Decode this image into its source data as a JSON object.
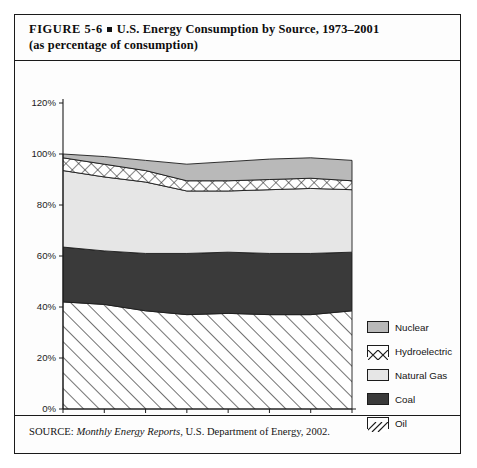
{
  "figure": {
    "label": "FIGURE  5-6",
    "title_line1": "U.S. Energy Consumption by Source, 1973–2001",
    "title_line2": "(as percentage of consumption)",
    "source_prefix": "SOURCE:",
    "source_italic": "Monthly Energy Reports",
    "source_rest": ", U.S. Department of Energy, 2002."
  },
  "legend": {
    "items": [
      {
        "label": "Nuclear",
        "pattern": "solid-medium-gray",
        "color": "#b9b9b9"
      },
      {
        "label": "Hydroelectric",
        "pattern": "cross-hatch",
        "color": "#ffffff"
      },
      {
        "label": "Natural Gas",
        "pattern": "solid-light-gray",
        "color": "#e6e6e6"
      },
      {
        "label": "Coal",
        "pattern": "solid-dark",
        "color": "#3a3a3a"
      },
      {
        "label": "Oil",
        "pattern": "diagonal-hatch",
        "color": "#ffffff"
      }
    ]
  },
  "chart_data": {
    "type": "area",
    "title": "U.S. Energy Consumption by Source, 1973–2001",
    "subtitle": "(as percentage of consumption)",
    "xlabel": "",
    "ylabel": "",
    "stacked": true,
    "grid": false,
    "legend_position": "right",
    "ylim": [
      0,
      120
    ],
    "yticks": [
      0,
      20,
      40,
      60,
      80,
      100,
      120
    ],
    "ytick_labels": [
      "0%",
      "20%",
      "40%",
      "60%",
      "80%",
      "100%",
      "120%"
    ],
    "xticks": [
      1973,
      1977,
      1981,
      1985,
      1989,
      1993,
      1997,
      2001
    ],
    "xtick_labels": [
      "1973",
      "1977",
      "1981",
      "1985",
      "1989",
      "1993",
      "1997",
      "2001"
    ],
    "x": [
      1973,
      1977,
      1981,
      1985,
      1989,
      1993,
      1997,
      2001
    ],
    "series": [
      {
        "name": "Oil",
        "values": [
          42.0,
          41.0,
          38.5,
          37.0,
          37.5,
          37.0,
          37.0,
          38.5
        ]
      },
      {
        "name": "Coal",
        "values": [
          21.5,
          21.0,
          22.5,
          24.0,
          24.0,
          24.0,
          24.0,
          23.0
        ]
      },
      {
        "name": "Natural Gas",
        "values": [
          30.0,
          29.0,
          28.0,
          24.5,
          24.0,
          25.0,
          25.5,
          24.5
        ]
      },
      {
        "name": "Hydroelectric",
        "values": [
          5.0,
          5.0,
          4.5,
          4.0,
          4.0,
          4.0,
          4.0,
          3.5
        ]
      },
      {
        "name": "Nuclear",
        "values": [
          1.5,
          3.0,
          4.0,
          6.5,
          7.5,
          8.0,
          8.0,
          8.0
        ]
      }
    ],
    "cumulative_tops": {
      "Oil": [
        42.0,
        41.0,
        38.5,
        37.0,
        37.5,
        37.0,
        37.0,
        38.5
      ],
      "Coal": [
        63.5,
        62.0,
        61.0,
        61.0,
        61.5,
        61.0,
        61.0,
        61.5
      ],
      "Natural Gas": [
        93.5,
        91.0,
        89.0,
        85.5,
        85.5,
        86.0,
        86.5,
        86.0
      ],
      "Hydroelectric": [
        98.5,
        96.0,
        93.5,
        89.5,
        89.5,
        90.0,
        90.5,
        89.5
      ],
      "Nuclear": [
        100.0,
        99.0,
        97.5,
        96.0,
        97.0,
        98.0,
        98.5,
        97.5
      ]
    }
  }
}
